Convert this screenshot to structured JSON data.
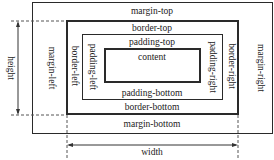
{
  "diagram": {
    "labels": {
      "margin_top": "margin-top",
      "margin_bottom": "margin-bottom",
      "margin_left": "margin-left",
      "margin_right": "margin-right",
      "border_top": "border-top",
      "border_bottom": "border-bottom",
      "border_left": "border-left",
      "border_right": "border-right",
      "padding_top": "padding-top",
      "padding_bottom": "padding-bottom",
      "padding_left": "padding-left",
      "padding_right": "padding-right",
      "content": "content",
      "height": "height",
      "width": "width"
    },
    "colors": {
      "line": "#2a2a2a",
      "dashed": "#555555",
      "background": "#ffffff"
    }
  }
}
